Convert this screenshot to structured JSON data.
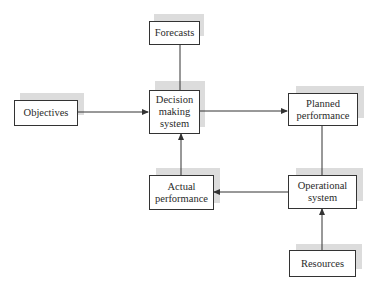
{
  "diagram": {
    "type": "block-flow",
    "nodes": [
      {
        "id": "forecasts",
        "label": "Forecasts"
      },
      {
        "id": "objectives",
        "label": "Objectives"
      },
      {
        "id": "decision",
        "label": "Decision making system",
        "lines": [
          "Decision",
          "making",
          "system"
        ]
      },
      {
        "id": "planned",
        "label": "Planned performance",
        "lines": [
          "Planned",
          "performance"
        ]
      },
      {
        "id": "actual",
        "label": "Actual performance",
        "lines": [
          "Actual",
          "performance"
        ]
      },
      {
        "id": "operational",
        "label": "Operational system",
        "lines": [
          "Operational",
          "system"
        ]
      },
      {
        "id": "resources",
        "label": "Resources"
      }
    ],
    "edges": [
      {
        "from": "forecasts",
        "to": "decision",
        "arrow": false
      },
      {
        "from": "objectives",
        "to": "decision",
        "arrow": true
      },
      {
        "from": "decision",
        "to": "planned",
        "arrow": true
      },
      {
        "from": "planned",
        "to": "operational",
        "arrow": false
      },
      {
        "from": "operational",
        "to": "actual",
        "arrow": true
      },
      {
        "from": "actual",
        "to": "decision",
        "arrow": true
      },
      {
        "from": "resources",
        "to": "operational",
        "arrow": true
      }
    ],
    "colors": {
      "line": "#333333",
      "shadow": "#dcdcdc",
      "box_fill": "#ffffff"
    }
  }
}
